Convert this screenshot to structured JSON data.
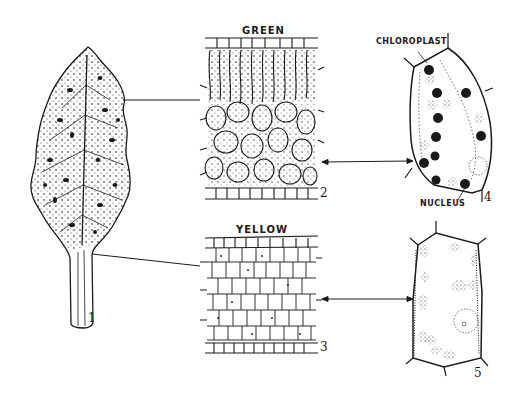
{
  "figure": {
    "labels": {
      "green": "GREEN",
      "yellow": "YELLOW",
      "chloroplast": "CHLOROPLAST",
      "nucleus": "NUCLEUS"
    },
    "numbers": {
      "leaf": "1",
      "green_section": "2",
      "yellow_section": "3",
      "green_cell": "4",
      "yellow_cell": "5"
    },
    "parts": [
      {
        "id": "1",
        "description": "Mottled leaf (green and yellow areas)"
      },
      {
        "id": "2",
        "description": "Cross section of green tissue"
      },
      {
        "id": "3",
        "description": "Cross section of yellow tissue"
      },
      {
        "id": "4",
        "description": "Green-tissue cell with chloroplasts and nucleus"
      },
      {
        "id": "5",
        "description": "Yellow-tissue cell with degraded chloroplasts"
      }
    ],
    "colors": {
      "ink": "#1a1a1a",
      "background": "#ffffff"
    }
  }
}
